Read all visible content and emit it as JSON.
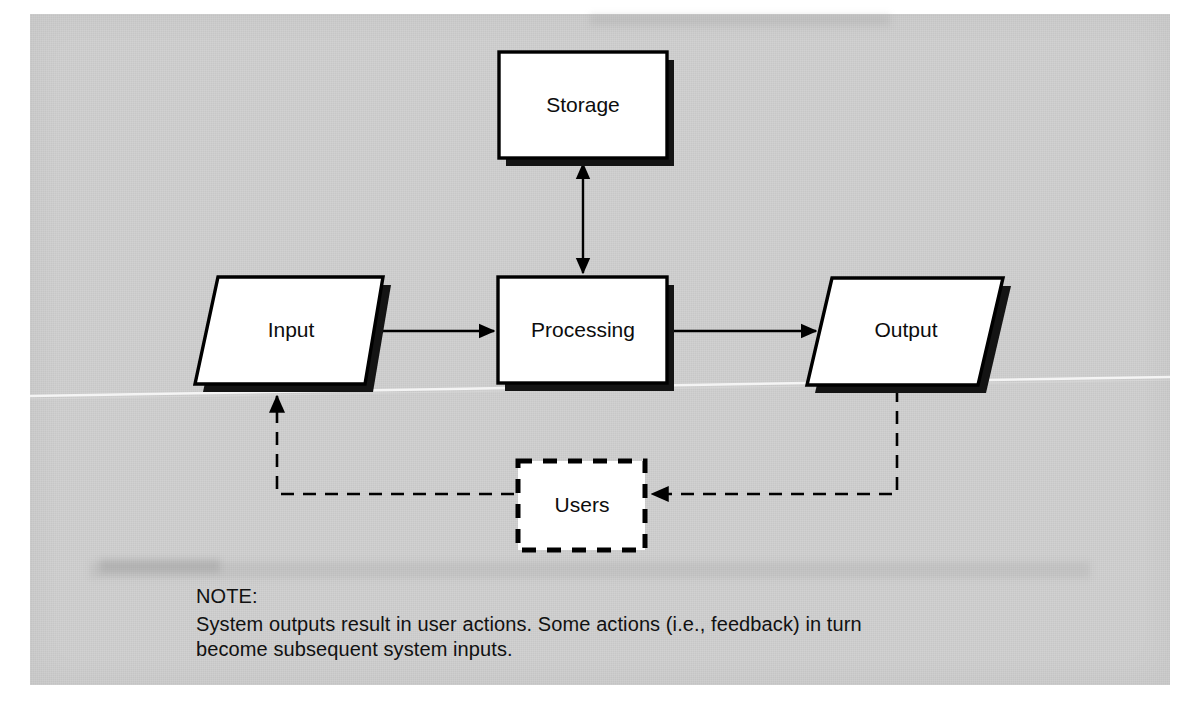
{
  "diagram": {
    "nodes": [
      {
        "id": "storage",
        "label": "Storage",
        "shape": "rectangle",
        "style": "solid-shadow"
      },
      {
        "id": "input",
        "label": "Input",
        "shape": "parallelogram",
        "style": "solid-shadow"
      },
      {
        "id": "processing",
        "label": "Processing",
        "shape": "rectangle",
        "style": "solid-shadow"
      },
      {
        "id": "output",
        "label": "Output",
        "shape": "parallelogram",
        "style": "solid-shadow"
      },
      {
        "id": "users",
        "label": "Users",
        "shape": "rectangle",
        "style": "dashed"
      }
    ],
    "edges": [
      {
        "from": "processing",
        "to": "storage",
        "style": "solid",
        "arrows": "both"
      },
      {
        "from": "input",
        "to": "processing",
        "style": "solid",
        "arrows": "end"
      },
      {
        "from": "processing",
        "to": "output",
        "style": "solid",
        "arrows": "end"
      },
      {
        "from": "output",
        "to": "users",
        "style": "dashed",
        "arrows": "end"
      },
      {
        "from": "users",
        "to": "input",
        "style": "dashed",
        "arrows": "end"
      }
    ],
    "colors": {
      "node_fill": "#ffffff",
      "node_stroke": "#000000",
      "shadow": "#111111",
      "panel_background": "#cfcfcf",
      "text": "#0d0d0d"
    }
  },
  "note": {
    "title": "NOTE:",
    "body": "System outputs result in user actions.  Some actions (i.e., feedback) in turn become subsequent system inputs."
  }
}
